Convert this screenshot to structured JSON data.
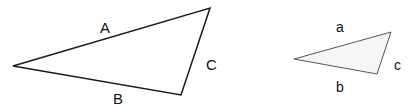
{
  "diagram": {
    "large_triangle": {
      "vertices": [
        [
          13,
          66
        ],
        [
          210,
          8
        ],
        [
          181,
          95
        ]
      ],
      "labels": {
        "side_a": "A",
        "side_b": "B",
        "side_c": "C"
      },
      "stroke": "#1a1a1a"
    },
    "small_triangle": {
      "vertices": [
        [
          294,
          59
        ],
        [
          391,
          32
        ],
        [
          377,
          74
        ]
      ],
      "labels": {
        "side_a": "a",
        "side_b": "b",
        "side_c": "c"
      },
      "stroke": "#555555",
      "fill": "#f6f6f6"
    }
  }
}
